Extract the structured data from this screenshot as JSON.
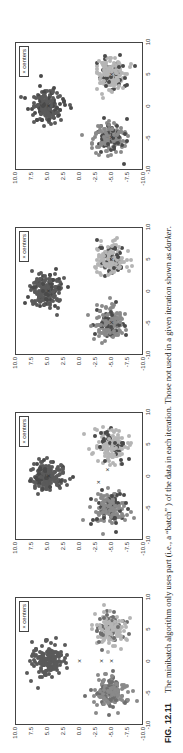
{
  "figure": {
    "label": "FIG. 12.11",
    "caption_parts": [
      "The minibatch algorithm only uses part (i.e., a “batch” ) of the data in each iteration. Those not used in a given iteration shown as ",
      "darker",
      "."
    ]
  },
  "chart_data": [
    {
      "type": "scatter",
      "title": "Iteration 1",
      "xlim": [
        -10,
        10
      ],
      "ylim": [
        -10,
        10
      ],
      "xticks": [
        "-10",
        "-5",
        "0",
        "5",
        "10"
      ],
      "yticks": [
        "10.0",
        "7.5",
        "5.0",
        "2.5",
        "0.0",
        "-2.5",
        "-5.0",
        "-7.5",
        "-10.0"
      ],
      "legend": [
        "centers"
      ],
      "clusters": [
        {
          "center": [
            0,
            5
          ],
          "color": "#5a5a5a"
        },
        {
          "center": [
            -5,
            -5
          ],
          "color": "#8a8a8a"
        },
        {
          "center": [
            5,
            -5
          ],
          "color": "#b5b5b5"
        }
      ],
      "centers": [
        [
          0,
          0
        ],
        [
          0,
          -3.5
        ],
        [
          0,
          -5
        ]
      ]
    },
    {
      "type": "scatter",
      "title": "Iteration 2",
      "xlim": [
        -10,
        10
      ],
      "ylim": [
        -10,
        10
      ],
      "xticks": [
        "-10",
        "-5",
        "0",
        "5",
        "10"
      ],
      "yticks": [
        "10.0",
        "7.5",
        "5.0",
        "2.5",
        "0.0",
        "-2.5",
        "-5.0",
        "-7.5",
        "-10.0"
      ],
      "legend": [
        "centers"
      ],
      "clusters": [
        {
          "center": [
            0,
            5
          ],
          "color": "#5a5a5a"
        },
        {
          "center": [
            -5,
            -5
          ],
          "color": "#8a8a8a"
        },
        {
          "center": [
            5,
            -5
          ],
          "color": "#b5b5b5"
        }
      ],
      "centers": [
        [
          0,
          5
        ],
        [
          -1,
          -3
        ],
        [
          1,
          -4.5
        ]
      ]
    },
    {
      "type": "scatter",
      "title": "Iteration 3",
      "xlim": [
        -10,
        10
      ],
      "ylim": [
        -10,
        10
      ],
      "xticks": [
        "-10",
        "-5",
        "0",
        "5",
        "10"
      ],
      "yticks": [
        "10.0",
        "7.5",
        "5.0",
        "2.5",
        "0.0",
        "-2.5",
        "-5.0",
        "-7.5",
        "-10.0"
      ],
      "legend": [
        "centers"
      ],
      "clusters": [
        {
          "center": [
            0,
            5
          ],
          "color": "#5a5a5a"
        },
        {
          "center": [
            -5,
            -5
          ],
          "color": "#8a8a8a"
        },
        {
          "center": [
            5,
            -5
          ],
          "color": "#b5b5b5"
        }
      ],
      "centers": [
        [
          0,
          5
        ],
        [
          -5,
          -5
        ],
        [
          5,
          -5
        ]
      ]
    },
    {
      "type": "scatter",
      "title": "Iteration 4",
      "xlim": [
        -10,
        10
      ],
      "ylim": [
        -10,
        10
      ],
      "xticks": [
        "-10",
        "-5",
        "0",
        "5",
        "10"
      ],
      "yticks": [
        "10.0",
        "7.5",
        "5.0",
        "2.5",
        "0.0",
        "-2.5",
        "-5.0",
        "-7.5",
        "-10.0"
      ],
      "legend": [
        "centers"
      ],
      "clusters": [
        {
          "center": [
            0,
            5
          ],
          "color": "#5a5a5a"
        },
        {
          "center": [
            -5,
            -5
          ],
          "color": "#8a8a8a"
        },
        {
          "center": [
            5,
            -5
          ],
          "color": "#b5b5b5"
        }
      ],
      "centers": [
        [
          0,
          5
        ],
        [
          -5,
          -5
        ],
        [
          5,
          -5
        ]
      ]
    }
  ]
}
